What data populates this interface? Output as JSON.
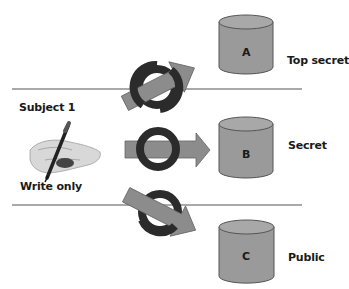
{
  "subject": {
    "label": "Subject 1",
    "mode": "Write only",
    "icon": "hand-writing-with-pen"
  },
  "levels": [
    {
      "name": "Top secret",
      "object": "A",
      "access": "blocked",
      "arrow_direction": "up"
    },
    {
      "name": "Secret",
      "object": "B",
      "access": "blocked",
      "arrow_direction": "right"
    },
    {
      "name": "Public",
      "object": "C",
      "access": "blocked",
      "arrow_direction": "down"
    }
  ],
  "colors": {
    "cylinder_fill": "#9a9a9a",
    "cylinder_top": "#a8a8a8",
    "cylinder_stroke": "#555555",
    "arrow_fill": "#8c8c8c",
    "ring": "#2b2b2b",
    "divider": "#555555"
  }
}
